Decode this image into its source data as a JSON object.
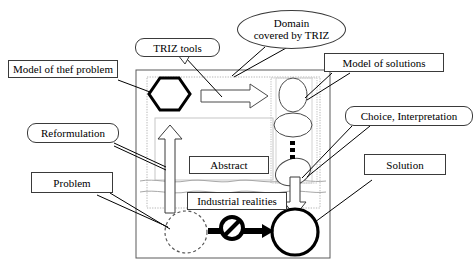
{
  "diagram": {
    "type": "flow-diagram",
    "colors": {
      "stroke": "#000000",
      "label_border": "#3a3a3a",
      "faint_frame": "#9a9a9a",
      "dotted_frame": "#b0b0b0",
      "wave_line": "#a8a8a8",
      "background": "#ffffff"
    }
  },
  "callouts": {
    "model_of_problem": {
      "text": "Model of thef problem",
      "shape": "rect"
    },
    "triz_tools": {
      "text": "TRIZ tools",
      "shape": "rounded-rect-with-tail"
    },
    "domain_covered": {
      "line1": "Domain",
      "line2": "covered by TRIZ",
      "shape": "ellipse"
    },
    "model_of_solutions": {
      "text": "Model of solutions",
      "shape": "rect"
    },
    "choice_interpretation": {
      "text": "Choice, Interpretation",
      "shape": "rounded-rect"
    },
    "reformulation": {
      "text": "Reformulation",
      "shape": "rounded-rect"
    },
    "problem": {
      "text": "Problem",
      "shape": "rect"
    },
    "solution": {
      "text": "Solution",
      "shape": "rect"
    }
  },
  "inner_labels": {
    "abstract": {
      "text": "Abstract",
      "shape": "rect"
    },
    "industrial_realities": {
      "text": "Industrial realities",
      "shape": "rect"
    }
  },
  "shapes": {
    "hexagon": {
      "name": "model-of-problem-hexagon",
      "stroke_width": 3
    },
    "right_block_arrow": {
      "name": "triz-tools-arrow",
      "direction": "right"
    },
    "up_block_arrow": {
      "name": "reformulation-arrow",
      "direction": "up"
    },
    "down_block_arrow": {
      "name": "interpretation-arrow",
      "direction": "down"
    },
    "solution_ellipses": {
      "count": 3,
      "vertical_dots": 3
    },
    "problem_circle": {
      "style": "dashed",
      "stroke_width": 1
    },
    "solution_circle": {
      "style": "solid",
      "stroke_width": 3
    },
    "blocked_arrow": {
      "symbol": "no-entry",
      "description": "thick arrow crossed by prohibition sign"
    }
  }
}
